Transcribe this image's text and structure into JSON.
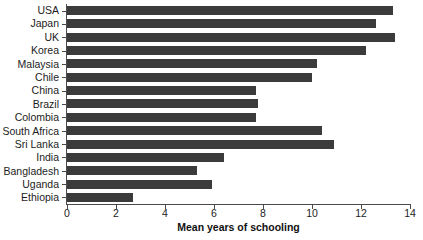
{
  "chart_data": {
    "type": "bar",
    "orientation": "horizontal",
    "title": "",
    "subtitle": "",
    "xlabel": "Mean years of schooling",
    "ylabel": "",
    "xlim": [
      0,
      14
    ],
    "xticks": [
      0,
      2,
      4,
      6,
      8,
      10,
      12,
      14
    ],
    "grid": false,
    "legend": null,
    "bar_color": "#3b3b3b",
    "axis_color": "#4a4a4a",
    "background_color": "#ffffff",
    "categories": [
      "USA",
      "Japan",
      "UK",
      "Korea",
      "Malaysia",
      "Chile",
      "China",
      "Brazil",
      "Colombia",
      "South Africa",
      "Sri Lanka",
      "India",
      "Bangladesh",
      "Uganda",
      "Ethiopia"
    ],
    "values": [
      13.3,
      12.6,
      13.4,
      12.2,
      10.2,
      10.0,
      7.7,
      7.8,
      7.7,
      10.4,
      10.9,
      6.4,
      5.3,
      5.9,
      2.7
    ]
  }
}
